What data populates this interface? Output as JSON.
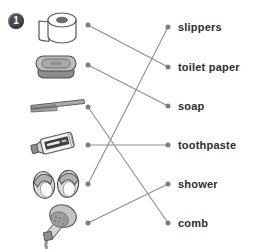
{
  "badge": {
    "number": "1"
  },
  "items": [
    {
      "key": "toilet-paper",
      "icon": "toilet-paper-icon"
    },
    {
      "key": "soap",
      "icon": "soap-icon"
    },
    {
      "key": "comb",
      "icon": "comb-icon"
    },
    {
      "key": "toothpaste",
      "icon": "toothpaste-icon"
    },
    {
      "key": "slippers",
      "icon": "slippers-icon"
    },
    {
      "key": "shower",
      "icon": "shower-icon"
    }
  ],
  "words": [
    {
      "key": "slippers",
      "label": "slippers"
    },
    {
      "key": "toilet-paper",
      "label": "toilet paper"
    },
    {
      "key": "soap",
      "label": "soap"
    },
    {
      "key": "toothpaste",
      "label": "toothpaste"
    },
    {
      "key": "shower",
      "label": "shower"
    },
    {
      "key": "comb",
      "label": "comb"
    }
  ],
  "connections": [
    {
      "from": "toilet-paper",
      "to": "toilet-paper"
    },
    {
      "from": "soap",
      "to": "soap"
    },
    {
      "from": "comb",
      "to": "comb"
    },
    {
      "from": "toothpaste",
      "to": "toothpaste"
    },
    {
      "from": "slippers",
      "to": "slippers"
    },
    {
      "from": "shower",
      "to": "shower"
    }
  ],
  "colors": {
    "line": "#8d8d8d",
    "dot": "#7d7d7d",
    "text": "#2e2e2e",
    "badge_bg": "#4a4a4a",
    "badge_text": "#ffffff"
  }
}
